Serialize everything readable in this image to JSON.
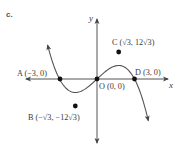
{
  "figure": {
    "part_label": "c.",
    "axis_x_label": "x",
    "axis_y_label": "y"
  },
  "points": {
    "A": {
      "label": "A (−3, 0)"
    },
    "B": {
      "label": "B (−√3, −12√3)"
    },
    "C": {
      "label": "C (√3, 12√3)"
    },
    "D": {
      "label": "D (3, 0)"
    },
    "O": {
      "label": "O (0, 0)"
    }
  },
  "colors": {
    "curve": "#555555",
    "axis": "#555555",
    "point": "#111111",
    "text": "#3a3a3a"
  },
  "chart_data": {
    "type": "line",
    "title": "",
    "function": "y = -x^3 + 9x",
    "xlabel": "x",
    "ylabel": "y",
    "grid": false,
    "legend": "none",
    "xlim": [
      -5.6,
      5.6
    ],
    "ylim": [
      -49,
      46
    ],
    "x_ticks": [],
    "y_ticks": [],
    "points": [
      {
        "name": "A",
        "x": -3,
        "y": 0,
        "label": "A (−3, 0)"
      },
      {
        "name": "B",
        "x": -1.732,
        "y": -20.78,
        "label": "B (−√3, −12√3)"
      },
      {
        "name": "O",
        "x": 0,
        "y": 0,
        "label": "O (0, 0)"
      },
      {
        "name": "C",
        "x": 1.732,
        "y": 20.78,
        "label": "C (√3, 12√3)"
      },
      {
        "name": "D",
        "x": 3,
        "y": 0,
        "label": "D (3, 0)"
      }
    ],
    "series": [
      {
        "name": "curve",
        "x": [
          -3.95,
          -3.5,
          -3,
          -2.5,
          -2,
          -1.732,
          -1.5,
          -1,
          -0.5,
          0,
          0.5,
          1,
          1.5,
          1.732,
          2,
          2.5,
          3,
          3.5,
          4,
          4.1
        ],
        "y": [
          25.9,
          11.4,
          0,
          -6.9,
          -10,
          -10.4,
          -10.1,
          -8,
          -4.4,
          0,
          4.4,
          8,
          10.1,
          10.4,
          10,
          6.9,
          0,
          -11.4,
          -28,
          -32
        ]
      }
    ],
    "annotations": [
      "c.",
      "A (−3, 0)",
      "B (−√3, −12√3)",
      "C (√3, 12√3)",
      "D (3, 0)",
      "O (0, 0)"
    ]
  }
}
